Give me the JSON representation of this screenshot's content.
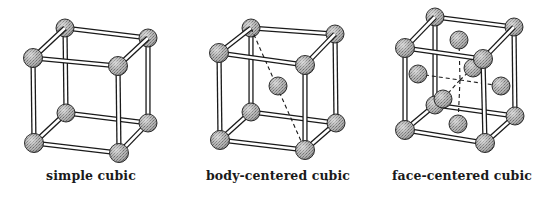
{
  "figure": {
    "colors": {
      "background": "#ffffff",
      "ink": "#1a1a1a",
      "rod_fill": "#ffffff",
      "sphere_light": "#d0d0d0",
      "sphere_mid": "#a4a4a4",
      "sphere_dark": "#6a6a6a"
    },
    "panels": [
      {
        "id": "simple-cubic",
        "label": "simple cubic",
        "label_pos": [
          91,
          168
        ],
        "corners": {
          "btl": [
            65,
            28
          ],
          "btr": [
            148,
            38
          ],
          "ftl": [
            33,
            58
          ],
          "ftr": [
            118,
            66
          ],
          "bbl": [
            66,
            113
          ],
          "bbr": [
            148,
            123
          ],
          "fbl": [
            34,
            143
          ],
          "fbr": [
            119,
            153
          ]
        },
        "extra_spheres": [],
        "dashed": []
      },
      {
        "id": "body-centered-cubic",
        "label": "body-centered cubic",
        "label_pos": [
          278,
          168
        ],
        "corners": {
          "btl": [
            251,
            28
          ],
          "btr": [
            335,
            34
          ],
          "ftl": [
            219,
            53
          ],
          "ftr": [
            305,
            65
          ],
          "bbl": [
            251,
            112
          ],
          "bbr": [
            336,
            123
          ],
          "fbl": [
            220,
            140
          ],
          "fbr": [
            305,
            150
          ]
        },
        "extra_spheres": [
          [
            278,
            86
          ]
        ],
        "dashed": [
          [
            [
              251,
              28
            ],
            [
              305,
              150
            ]
          ]
        ]
      },
      {
        "id": "face-centered-cubic",
        "label": "face-centered cubic",
        "label_pos": [
          462,
          168
        ],
        "corners": {
          "btl": [
            435,
            17
          ],
          "btr": [
            514,
            27
          ],
          "ftl": [
            405,
            48
          ],
          "ftr": [
            483,
            59
          ],
          "bbl": [
            435,
            105
          ],
          "bbr": [
            515,
            116
          ],
          "fbl": [
            405,
            130
          ],
          "fbr": [
            485,
            143
          ]
        },
        "extra_spheres": [
          [
            473,
            68
          ],
          [
            459,
            40
          ],
          [
            418,
            74
          ],
          [
            501,
            86
          ],
          [
            458,
            124
          ],
          [
            443,
            99
          ]
        ],
        "dashed": [
          [
            [
              418,
              74
            ],
            [
              460,
              80
            ]
          ],
          [
            [
              460,
              80
            ],
            [
              501,
              86
            ]
          ],
          [
            [
              459,
              40
            ],
            [
              460,
              80
            ]
          ],
          [
            [
              460,
              80
            ],
            [
              458,
              124
            ]
          ],
          [
            [
              473,
              68
            ],
            [
              460,
              80
            ]
          ],
          [
            [
              460,
              80
            ],
            [
              443,
              99
            ]
          ]
        ]
      }
    ]
  }
}
